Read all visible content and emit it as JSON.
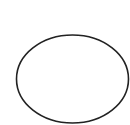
{
  "canvas": {
    "width": 130,
    "height": 125,
    "background": "#ffffff"
  },
  "shapes": [
    {
      "type": "ellipse",
      "cx": 72.5,
      "cy": 79,
      "rx": 56,
      "ry": 44,
      "stroke": "#222222",
      "stroke_width": 1.6,
      "fill": "none"
    }
  ]
}
